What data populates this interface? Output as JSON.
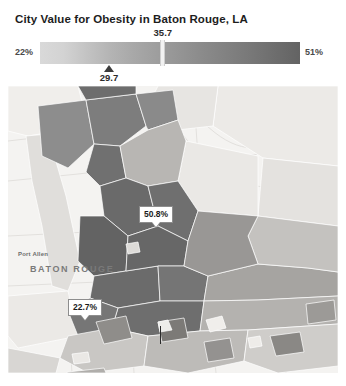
{
  "title": "City Value for Obesity in Baton Rouge, LA",
  "legend": {
    "min_label": "22%",
    "max_label": "51%",
    "tick_label": "35.7",
    "tick_value": 35.7,
    "marker_label": "29.7",
    "marker_value": 29.7,
    "domain_min": 22,
    "domain_max": 51,
    "ramp_start_color": "#d9d9d9",
    "ramp_end_color": "#636363"
  },
  "map": {
    "background_color": "#f4f3f1",
    "place_labels": [
      {
        "name": "Port Allen",
        "text": "Port Allen"
      },
      {
        "name": "Baton Rouge",
        "text": "BATON ROUGE"
      }
    ],
    "callouts": [
      {
        "name": "high-value",
        "text": "50.8%",
        "value": 50.8
      },
      {
        "name": "low-value",
        "text": "22.7%",
        "value": 22.7
      }
    ]
  },
  "chart_data": {
    "type": "heatmap",
    "title": "City Value for Obesity in Baton Rouge, LA",
    "subtype": "choropleth-map",
    "unit": "%",
    "legend_label_min": "22%",
    "legend_label_max": "51%",
    "value_min": 22,
    "value_max": 51,
    "city_value": 29.7,
    "reference_value": 35.7,
    "annotations": [
      {
        "label": "50.8%",
        "value": 50.8
      },
      {
        "label": "22.7%",
        "value": 22.7
      },
      {
        "label": "35.7",
        "value": 35.7
      },
      {
        "label": "29.7",
        "value": 29.7
      }
    ],
    "colorbar": {
      "start": "#d9d9d9",
      "end": "#636363",
      "orientation": "horizontal"
    },
    "region_values": [
      51,
      49,
      47,
      45,
      43,
      41,
      39,
      37,
      35,
      33,
      31,
      29,
      27,
      25,
      23
    ]
  }
}
